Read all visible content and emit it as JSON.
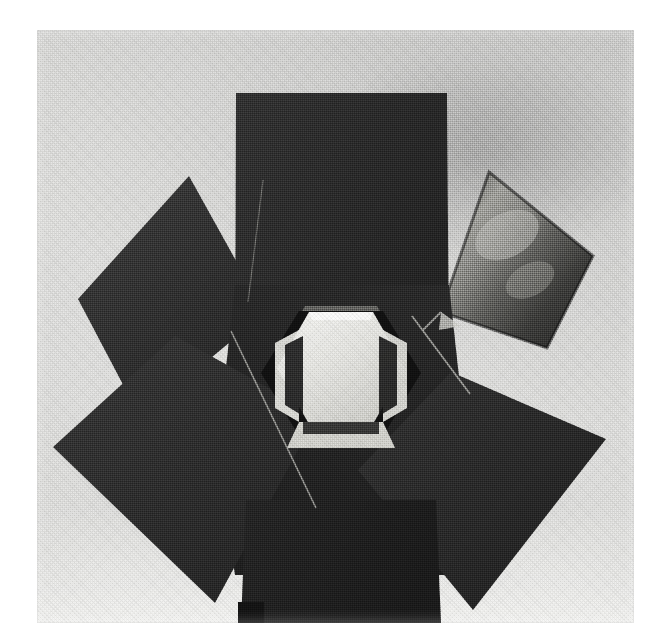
{
  "document": {
    "kind": "scanned-halftone-photograph",
    "medium": "black-and-white print",
    "caption": "",
    "alt_text": "Black and white photograph of a geometric sculpture: six dark flat panels arranged like petals around a bright hexagonal central opening, mounted on a dark column base."
  },
  "plate": {
    "name": "photographic-plate",
    "left": 37,
    "top": 30,
    "width": 597,
    "height": 593,
    "paper_color": "#ffffff",
    "background_color": "#dcdcda",
    "background_shadow_color": "#8c8c8c"
  },
  "subject": {
    "title": "Hexagonal petal sculpture",
    "center_aperture": {
      "name": "hexagonal-aperture",
      "shape": "hexagon",
      "highlight_color": "#ededea",
      "rim_color": "#bdbdb8",
      "shadow_color": "#1a1a1a"
    },
    "panels": [
      {
        "name": "panel-top",
        "position": "top",
        "shape": "rectangle",
        "fill": "#2b2b2b",
        "points": "236,93 447,93 447,355 236,355"
      },
      {
        "name": "panel-upper-left",
        "position": "upper-left",
        "shape": "quadrilateral",
        "fill": "#323232",
        "points": "189,176 263,306 140,412 78,299"
      },
      {
        "name": "panel-upper-right",
        "position": "upper-right",
        "shape": "quadrilateral",
        "fill": "#4e4e4e",
        "glare": true,
        "glare_color": "#a9a9a4",
        "points": "489,172 591,252 545,345 442,311"
      },
      {
        "name": "panel-lower-left",
        "position": "lower-left",
        "shape": "quadrilateral",
        "fill": "#2e2e2e",
        "points": "175,336 316,414 215,602 53,447"
      },
      {
        "name": "panel-lower-right",
        "position": "lower-right",
        "shape": "quadrilateral",
        "fill": "#2a2a2a",
        "points": "451,372 605,439 472,609 358,470"
      },
      {
        "name": "panel-center-shroud",
        "position": "center",
        "shape": "polygon",
        "fill": "#262626",
        "points": "236,300 447,300 447,560 236,560"
      }
    ],
    "base": {
      "name": "column-base",
      "fill": "#202020",
      "foot_fill": "#111111",
      "points": "246,520 436,520 441,621 241,621"
    },
    "seams": [
      {
        "name": "seam-left-diagonal",
        "color": "#9a9a96",
        "x1": 231,
        "y1": 331,
        "x2": 316,
        "y2": 508
      },
      {
        "name": "seam-right-diagonal",
        "color": "#9a9a96",
        "x1": 412,
        "y1": 316,
        "x2": 470,
        "y2": 394
      },
      {
        "name": "seam-left-panel-edge",
        "color": "#8d8d89",
        "x1": 262,
        "y1": 180,
        "x2": 247,
        "y2": 300
      }
    ]
  },
  "render": {
    "halftone_screen": true,
    "screen_angle_deg": 45,
    "grain": true
  }
}
